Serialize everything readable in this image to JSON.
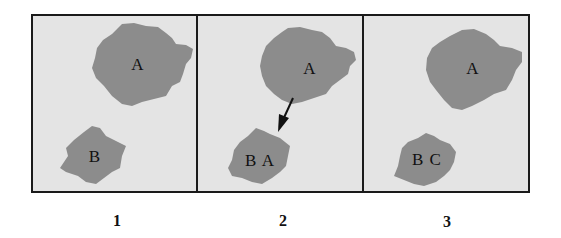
{
  "colors": {
    "panel_bg": "#e4e4e4",
    "blob": "#8c8c8c",
    "border": "#1a1a1a",
    "text": "#111111"
  },
  "panels": [
    {
      "caption": "1",
      "blobs": [
        {
          "label": "A"
        },
        {
          "label": "B"
        }
      ]
    },
    {
      "caption": "2",
      "blobs": [
        {
          "label": "A"
        },
        {
          "label": "B A"
        }
      ],
      "arrow": "arrow from blob A to blob B"
    },
    {
      "caption": "3",
      "blobs": [
        {
          "label": "A"
        },
        {
          "label": "B C"
        }
      ]
    }
  ]
}
